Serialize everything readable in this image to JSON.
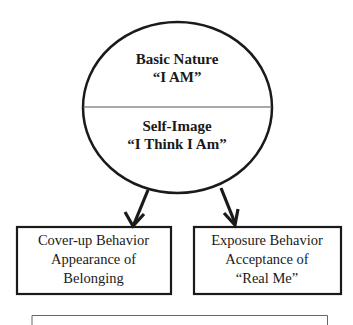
{
  "diagram": {
    "circle": {
      "top_section": {
        "line1": "Basic Nature",
        "line2": "“I AM”"
      },
      "bottom_section": {
        "line1": "Self-Image",
        "line2": "“I Think I Am”"
      }
    },
    "boxes": [
      {
        "line1": "Cover-up Behavior",
        "line2": "Appearance of",
        "line3": "Belonging"
      },
      {
        "line1": "Exposure Behavior",
        "line2": "Acceptance of",
        "line3": "“Real Me”"
      }
    ],
    "arrows": [
      {
        "from": "self-image",
        "to": "cover-up-behavior"
      },
      {
        "from": "self-image",
        "to": "exposure-behavior"
      }
    ],
    "colors": {
      "stroke": "#1a1a1a",
      "divider": "#555555",
      "bottom_box_stroke": "#666666",
      "background": "#ffffff"
    }
  }
}
